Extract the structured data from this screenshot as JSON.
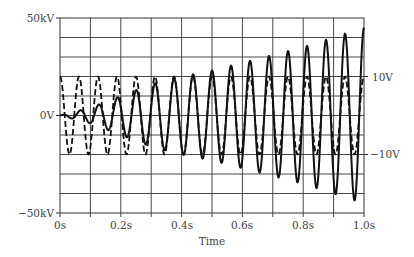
{
  "chart_data": {
    "type": "line",
    "title": "",
    "xlabel": "Time",
    "ylabel_left": "",
    "ylabel_right": "",
    "x_ticks": [
      "0s",
      "0.2s",
      "0.4s",
      "0.6s",
      "0.8s",
      "1.0s"
    ],
    "xlim": [
      0,
      1.0
    ],
    "y_left_ticks": [
      "50kV",
      "0V",
      "−50kV"
    ],
    "ylim_left_kV": [
      -50,
      50
    ],
    "y_right_ticks": [
      "10V",
      "−10V"
    ],
    "grid": true,
    "grid_divisions": {
      "x": 10,
      "y": 10
    },
    "legend": null,
    "series": [
      {
        "name": "Output voltage (solid)",
        "axis": "left",
        "style": "solid",
        "frequency_hz": 16,
        "envelope_t": [
          0.0,
          0.1,
          0.2,
          0.3,
          0.4,
          0.5,
          0.6,
          0.7,
          0.8,
          0.9,
          1.0
        ],
        "envelope_kV": [
          0,
          4,
          10,
          16,
          20,
          23,
          27,
          31,
          35,
          40,
          45
        ]
      },
      {
        "name": "Input voltage (dashed)",
        "axis": "right",
        "style": "dashed",
        "frequency_hz": 16,
        "amplitude_V": 10
      }
    ]
  },
  "labels": {
    "y_top": "50kV",
    "y_zero": "0V",
    "y_bottom": "−50kV",
    "y_right_top": "10V",
    "y_right_bottom": "−10V",
    "x0": "0s",
    "x1": "0.2s",
    "x2": "0.4s",
    "x3": "0.6s",
    "x4": "0.8s",
    "x5": "1.0s",
    "xlabel": "Time"
  }
}
